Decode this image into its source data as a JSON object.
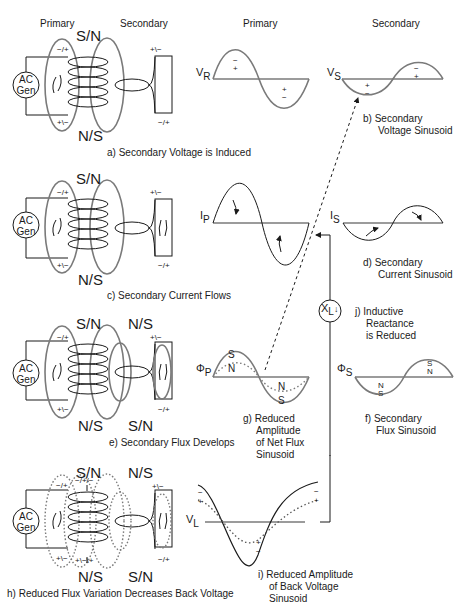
{
  "headers": {
    "left_primary": "Primary",
    "left_secondary": "Secondary",
    "right_primary": "Primary",
    "right_secondary": "Secondary"
  },
  "generator_label_line1": "AC",
  "generator_label_line2": "Gen",
  "polarity": {
    "top_primary": "−/+",
    "bottom_primary": "+\\−",
    "top_secondary": "+\\−",
    "bottom_secondary": "−/+",
    "top_mid_h": "−/+/−",
    "bottom_mid_h": "+\\−\\+"
  },
  "poles": {
    "primary_top": "S/N",
    "primary_bottom": "N/S",
    "secondary_top": "N/S",
    "secondary_bottom": "S/N"
  },
  "panels": {
    "a": {
      "caption": "a)  Secondary Voltage is Induced"
    },
    "b": {
      "caption_line1": "b)  Secondary",
      "caption_line2": "Voltage Sinusoid",
      "symbol": "V",
      "subscript": "S",
      "signs": [
        "+",
        "−",
        "−",
        "+"
      ]
    },
    "primary_v": {
      "symbol": "V",
      "subscript": "R",
      "signs": [
        "−",
        "+",
        "+",
        "−"
      ]
    },
    "c": {
      "caption": "c)  Secondary Current Flows"
    },
    "d": {
      "caption_line1": "d)  Secondary",
      "caption_line2": "Current Sinusoid",
      "symbol": "I",
      "subscript": "S"
    },
    "primary_i": {
      "symbol": "I",
      "subscript": "P"
    },
    "e": {
      "caption": "e)  Secondary Flux Develops"
    },
    "f": {
      "caption_line1": "f)  Secondary",
      "caption_line2": "Flux Sinusoid",
      "symbol": "Φ",
      "subscript": "S",
      "poles": [
        "N",
        "S",
        "S",
        "N"
      ]
    },
    "g": {
      "caption_line1": "g)  Reduced",
      "caption_line2": "Amplitude",
      "caption_line3": "of Net Flux",
      "caption_line4": "Sinusoid",
      "symbol": "Φ",
      "subscript": "P",
      "poles": [
        "S",
        "N",
        "N",
        "S"
      ]
    },
    "h": {
      "caption": "h)  Reduced Flux Variation Decreases Back Voltage"
    },
    "i": {
      "caption_line1": "i)  Reduced Amplitude",
      "caption_line2": "of Back Voltage",
      "caption_line3": "Sinusoid",
      "symbol": "V",
      "subscript": "L",
      "signs": [
        "−",
        "+",
        "+",
        "−"
      ]
    },
    "j": {
      "caption_line1": "j)  Inductive",
      "caption_line2": "Reactance",
      "caption_line3": "is Reduced",
      "symbol": "X",
      "subscript": "L",
      "arrow": "↓"
    }
  },
  "colors": {
    "line": "#1a1a1a",
    "gray": "#7a7a7a",
    "background": "#ffffff"
  }
}
